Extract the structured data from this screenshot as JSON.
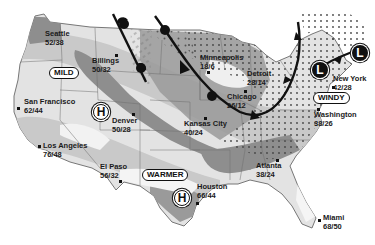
{
  "map": {
    "title": "U.S. weather map",
    "colors": {
      "land_light": "#e6e6e6",
      "land_mid": "#c4c4c4",
      "land_dark": "#8f8f8f",
      "pattern_dot": "#555555",
      "front": "#111111",
      "border": "#6a6a6a"
    },
    "cities": [
      {
        "name": "Seattle",
        "temps": "52/38"
      },
      {
        "name": "Billings",
        "temps": "50/32"
      },
      {
        "name": "San Francisco",
        "temps": "62/44"
      },
      {
        "name": "Los Angeles",
        "temps": "76/48"
      },
      {
        "name": "Denver",
        "temps": "50/28"
      },
      {
        "name": "El Paso",
        "temps": "56/32"
      },
      {
        "name": "Kansas City",
        "temps": "40/24"
      },
      {
        "name": "Minneapolis",
        "temps": "18/6"
      },
      {
        "name": "Chicago",
        "temps": "26/12"
      },
      {
        "name": "Detroit",
        "temps": "28/14"
      },
      {
        "name": "New York",
        "temps": "42/28"
      },
      {
        "name": "Washington",
        "temps": "38/26"
      },
      {
        "name": "Atlanta",
        "temps": "38/24"
      },
      {
        "name": "Houston",
        "temps": "66/44"
      },
      {
        "name": "Miami",
        "temps": "68/50"
      }
    ],
    "condition_labels": {
      "mild": "MILD",
      "warmer": "WARMER",
      "windy": "WINDY"
    },
    "pressure_systems": {
      "high_west": "H",
      "high_south": "H",
      "low_east": "L",
      "low_northeast": "L"
    },
    "icons": {
      "cold_front": "cold-front-line",
      "stationary_front": "front-line",
      "snow_pattern": "dot-pattern",
      "rain_pattern": "hatch-pattern"
    }
  }
}
